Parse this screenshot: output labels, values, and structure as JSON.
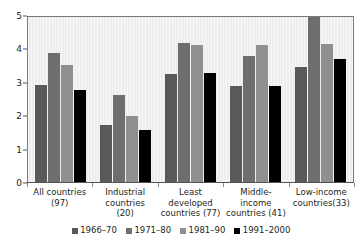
{
  "chart_data": {
    "type": "bar",
    "title": "",
    "subtitle": "",
    "xlabel": "",
    "ylabel": "",
    "ylim": [
      0,
      5
    ],
    "yticks": [
      0,
      1,
      2,
      3,
      4,
      5
    ],
    "ytick_labels": [
      "0",
      "1",
      "2",
      "3",
      "4",
      "5"
    ],
    "grid": false,
    "legend_position": "bottom",
    "categories": [
      "All countries (97)",
      "Industrial countries (20)",
      "Least developed countries (77)",
      "Middle-income countries (41)",
      "Low-income countries(33)"
    ],
    "category_lines": [
      [
        "All countries",
        "(97)"
      ],
      [
        "Industrial",
        "countries",
        "(20)"
      ],
      [
        "Least",
        "developed",
        "countries (77)"
      ],
      [
        "Middle-",
        "income",
        "countries (41)"
      ],
      [
        "Low-income",
        "countries(33)"
      ]
    ],
    "series": [
      {
        "name": "1966-70",
        "color": "#595959",
        "values": [
          2.9,
          1.72,
          3.22,
          2.88,
          3.44
        ]
      },
      {
        "name": "1971-80",
        "color": "#6e6e6e",
        "values": [
          3.85,
          2.62,
          4.15,
          3.76,
          5.0
        ]
      },
      {
        "name": "1981-90",
        "color": "#8f8f8f",
        "values": [
          3.5,
          1.97,
          4.1,
          4.1,
          4.12
        ]
      },
      {
        "name": "1991-2000",
        "color": "#000000",
        "values": [
          2.75,
          1.55,
          3.27,
          2.88,
          3.68
        ]
      }
    ]
  },
  "legend": {
    "items": [
      {
        "label": "1966–70"
      },
      {
        "label": "1971–80"
      },
      {
        "label": "1981–90"
      },
      {
        "label": "1991–2000"
      }
    ]
  },
  "axes": {
    "y_tick_labels": [
      "5",
      "4",
      "3",
      "2",
      "1",
      "0"
    ]
  },
  "colors": {
    "plot_background": "#ededed",
    "axis": "#555555",
    "text": "#231f20",
    "series_1": "#595959",
    "series_2": "#6e6e6e",
    "series_3": "#8f8f8f",
    "series_4": "#000000"
  }
}
